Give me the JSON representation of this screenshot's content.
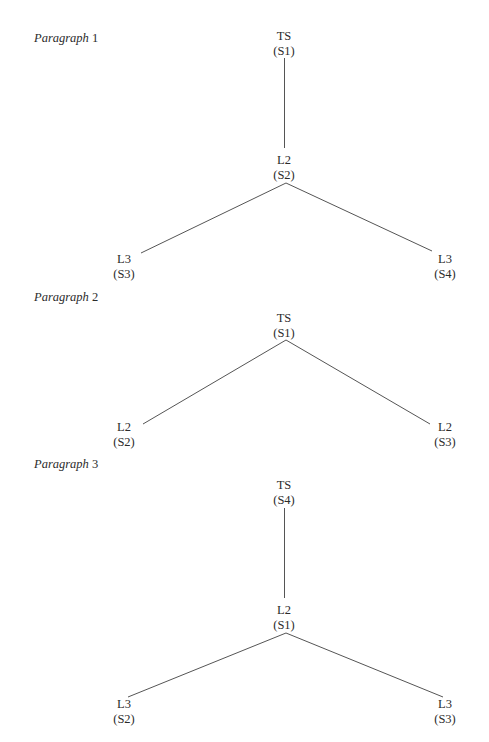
{
  "diagrams": [
    {
      "label_word": "Paragraph",
      "label_num": "1",
      "nodes": {
        "root": {
          "level": "TS",
          "sentence": "(S1)"
        },
        "mid": {
          "level": "L2",
          "sentence": "(S2)"
        },
        "left": {
          "level": "L3",
          "sentence": "(S3)"
        },
        "right": {
          "level": "L3",
          "sentence": "(S4)"
        }
      }
    },
    {
      "label_word": "Paragraph",
      "label_num": "2",
      "nodes": {
        "root": {
          "level": "TS",
          "sentence": "(S1)"
        },
        "left": {
          "level": "L2",
          "sentence": "(S2)"
        },
        "right": {
          "level": "L2",
          "sentence": "(S3)"
        }
      }
    },
    {
      "label_word": "Paragraph",
      "label_num": "3",
      "nodes": {
        "root": {
          "level": "TS",
          "sentence": "(S4)"
        },
        "mid": {
          "level": "L2",
          "sentence": "(S1)"
        },
        "left": {
          "level": "L3",
          "sentence": "(S2)"
        },
        "right": {
          "level": "L3",
          "sentence": "(S3)"
        }
      }
    }
  ]
}
